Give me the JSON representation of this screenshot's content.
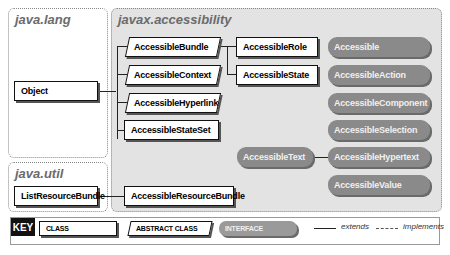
{
  "packages": {
    "java_lang": "java.lang",
    "javax_accessibility": "javax.accessibility",
    "java_util": "java.util"
  },
  "classes": {
    "object": "Object",
    "list_resource_bundle": "ListResourceBundle",
    "accessible_state_set": "AccessibleStateSet",
    "accessible_role": "AccessibleRole",
    "accessible_state": "AccessibleState",
    "accessible_resource_bundle": "AccessibleResourceBundle"
  },
  "abstract_classes": {
    "accessible_bundle": "AccessibleBundle",
    "accessible_context": "AccessibleContext",
    "accessible_hyperlink": "AccessibleHyperlink"
  },
  "interfaces": {
    "accessible": "Accessible",
    "accessible_action": "AccessibleAction",
    "accessible_component": "AccessibleComponent",
    "accessible_selection": "AccessibleSelection",
    "accessible_text": "AccessibleText",
    "accessible_hypertext": "AccessibleHypertext",
    "accessible_value": "AccessibleValue"
  },
  "key": {
    "label": "KEY",
    "class": "CLASS",
    "abstract_class": "ABSTRACT CLASS",
    "interface": "INTERFACE",
    "extends": "extends",
    "implements": "implements"
  },
  "colors": {
    "package_bg": "#e3e3e3",
    "interface_fill": "#8a8a8a",
    "border": "#111111"
  }
}
